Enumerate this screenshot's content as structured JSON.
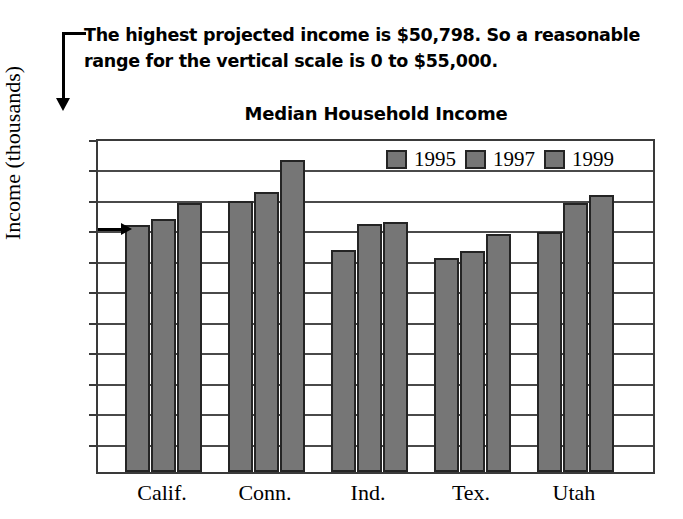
{
  "annotation": {
    "text": "The highest projected income is $50,798. So a reasonable range for the vertical scale is 0 to $55,000.",
    "pointer_value": "40.5",
    "leader_icon": "callout-arrow-icon"
  },
  "chart_data": {
    "type": "bar",
    "title": "Median Household Income",
    "xlabel": "",
    "ylabel": "Income (thousands)",
    "ylim": [
      0,
      55
    ],
    "yticks": [
      0,
      5,
      10,
      15,
      20,
      25,
      30,
      35,
      40,
      45,
      50,
      55
    ],
    "ytick_labels": [
      "0",
      "5",
      "10",
      "15",
      "20",
      "25",
      "30",
      "35",
      "40",
      "45",
      "50",
      "55"
    ],
    "grid": true,
    "legend_position": "top-right inside plot",
    "categories": [
      "Calif.",
      "Conn.",
      "Ind.",
      "Tex.",
      "Utah"
    ],
    "series": [
      {
        "name": "1995",
        "values": [
          40.5,
          44.5,
          36.5,
          35.2,
          39.4
        ]
      },
      {
        "name": "1997",
        "values": [
          41.5,
          46.0,
          40.7,
          36.3,
          44.2
        ]
      },
      {
        "name": "1999",
        "values": [
          44.2,
          51.2,
          41.1,
          39.0,
          45.5
        ]
      }
    ],
    "bar_color": "#767676",
    "bar_outline_color": "#242424",
    "axis_color": "#3a3a3a"
  }
}
